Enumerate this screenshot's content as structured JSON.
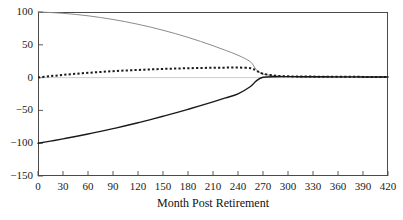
{
  "chart_data": {
    "type": "line",
    "title": "",
    "xlabel": "Month Post Retirement",
    "ylabel": "",
    "xlim": [
      0,
      420
    ],
    "ylim": [
      -150,
      100
    ],
    "grid": false,
    "legend": "none",
    "xticks": [
      "0",
      "30",
      "60",
      "90",
      "120",
      "150",
      "180",
      "210",
      "240",
      "270",
      "300",
      "330",
      "360",
      "390",
      "420"
    ],
    "xtick_values": [
      0,
      30,
      60,
      90,
      120,
      150,
      180,
      210,
      240,
      270,
      300,
      330,
      360,
      390,
      420
    ],
    "yticks": [
      "100",
      "50",
      "0",
      "-50",
      "-100",
      "-150"
    ],
    "ytick_values": [
      100,
      50,
      0,
      -50,
      -100,
      -150
    ],
    "x": [
      0,
      15,
      30,
      45,
      60,
      75,
      90,
      105,
      120,
      135,
      150,
      165,
      180,
      195,
      210,
      225,
      240,
      255,
      262,
      270,
      285,
      300,
      315,
      330,
      345,
      360,
      375,
      390,
      405,
      420
    ],
    "series": [
      {
        "name": "upper-gray-curve",
        "style": "solid",
        "color": "#8c8c8c",
        "width": 1,
        "values": [
          100,
          99.2,
          98,
          96.3,
          94.2,
          91.6,
          88.6,
          85.2,
          81.3,
          77,
          72.2,
          67,
          61.3,
          55.2,
          48.6,
          41.6,
          34.1,
          24.0,
          12.0,
          5.5,
          2.6,
          1.6,
          1.3,
          1.2,
          1.1,
          1.0,
          1.0,
          1.0,
          1.0,
          1.0
        ]
      },
      {
        "name": "lower-black-curve",
        "style": "solid",
        "color": "#1a1a1a",
        "width": 1.4,
        "values": [
          -100,
          -96.8,
          -93.4,
          -89.8,
          -86,
          -82,
          -77.8,
          -73.4,
          -68.8,
          -64,
          -59,
          -53.8,
          -48.4,
          -42.8,
          -37,
          -31,
          -24.8,
          -13.5,
          -5.0,
          0.5,
          1.4,
          1.5,
          1.4,
          1.3,
          1.2,
          1.1,
          1.1,
          1.0,
          1.0,
          1.0
        ]
      },
      {
        "name": "dotted-curve",
        "style": "dotted",
        "color": "#1a1a1a",
        "width": 2,
        "values": [
          0,
          2.2,
          4.1,
          5.8,
          7.3,
          8.6,
          9.8,
          10.8,
          11.7,
          12.5,
          13.2,
          13.8,
          14.3,
          14.7,
          15.0,
          15.2,
          15.3,
          14.4,
          10.5,
          6.0,
          3.0,
          2.0,
          1.7,
          1.5,
          1.4,
          1.3,
          1.2,
          1.1,
          1.0,
          1.0
        ]
      }
    ],
    "zero_reference_line": {
      "name": "zero-line",
      "value": 0,
      "color": "#b8b8b8"
    }
  }
}
